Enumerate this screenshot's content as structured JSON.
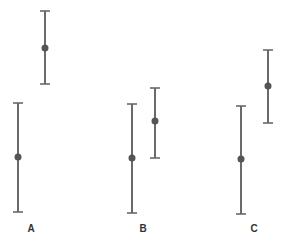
{
  "chart_data": {
    "type": "errorbar",
    "title": "",
    "xlabel": "",
    "ylabel": "",
    "categories": [
      "A",
      "B",
      "C"
    ],
    "grid": false,
    "legend": null,
    "note": "No y-axis shown; values in pixel-relative units (higher = larger). Each category has two intervals (left and right).",
    "series": [
      {
        "name": "left",
        "points": [
          {
            "category": "A",
            "x_px": 18,
            "center": 157,
            "low": 212,
            "high": 103
          },
          {
            "category": "B",
            "x_px": 132,
            "center": 158,
            "low": 213,
            "high": 104
          },
          {
            "category": "C",
            "x_px": 241,
            "center": 159,
            "low": 214,
            "high": 106
          }
        ]
      },
      {
        "name": "right",
        "points": [
          {
            "category": "A",
            "x_px": 45,
            "center": 48,
            "low": 84,
            "high": 11
          },
          {
            "category": "B",
            "x_px": 155,
            "center": 121,
            "low": 158,
            "high": 88
          },
          {
            "category": "C",
            "x_px": 268,
            "center": 86,
            "low": 123,
            "high": 50
          }
        ]
      }
    ],
    "labels": [
      {
        "text": "A",
        "x_px": 31,
        "y_px": 232
      },
      {
        "text": "B",
        "x_px": 143,
        "y_px": 232
      },
      {
        "text": "C",
        "x_px": 254,
        "y_px": 232
      }
    ]
  }
}
